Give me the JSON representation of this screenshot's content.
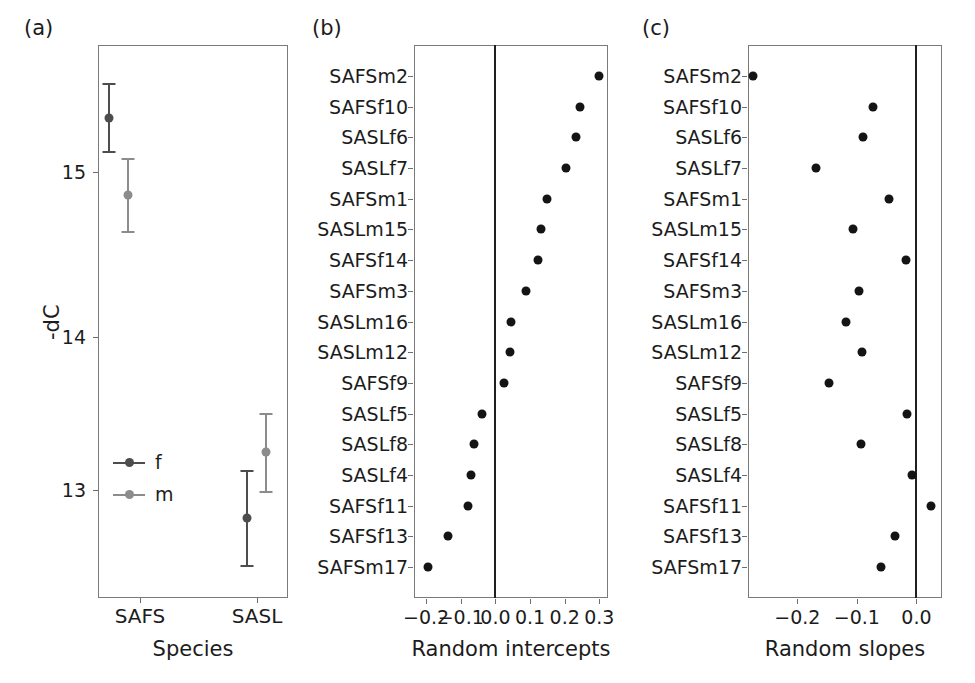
{
  "figure": {
    "background": "#ffffff",
    "point_color": "#141414",
    "female_color": "#4d4d4d",
    "male_color": "#8c8c8c",
    "axis_color": "#7a7a7a"
  },
  "panel_a": {
    "tag": "(a)",
    "ylabel": "-dC",
    "xlabel": "Species",
    "y_ticks": [
      "15",
      "14",
      "13"
    ],
    "y_tick_values": [
      15,
      14,
      13
    ],
    "categories": [
      "SAFS",
      "SASL"
    ],
    "legend": [
      {
        "key": "f",
        "label": "f",
        "color": "#4d4d4d"
      },
      {
        "key": "m",
        "label": "m",
        "color": "#8c8c8c"
      }
    ]
  },
  "panel_b": {
    "tag": "(b)",
    "xlabel": "Random intercepts",
    "x_ticks": [
      "−0.2",
      "−0.1",
      "0.0",
      "0.1",
      "0.2",
      "0.3"
    ],
    "x_tick_values": [
      -0.2,
      -0.1,
      0.0,
      0.1,
      0.2,
      0.3
    ]
  },
  "panel_c": {
    "tag": "(c)",
    "xlabel": "Random slopes",
    "x_ticks": [
      "−0.2",
      "−0.1",
      "0.0"
    ],
    "x_tick_values": [
      -0.2,
      -0.1,
      0.0
    ]
  },
  "chart_data": [
    {
      "type": "scatter",
      "panel": "a",
      "title": "",
      "xlabel": "Species",
      "ylabel": "-dC",
      "x_categories": [
        "SAFS",
        "SASL"
      ],
      "ylim": [
        12.35,
        15.75
      ],
      "yticks": [
        13,
        14,
        15
      ],
      "grid": false,
      "legend": [
        "f",
        "m"
      ],
      "legend_position": "inside-lower-left",
      "series": [
        {
          "name": "f",
          "color": "#4d4d4d",
          "points": [
            {
              "category": "SAFS",
              "mean": 15.31,
              "low": 15.09,
              "high": 15.53
            },
            {
              "category": "SASL",
              "mean": 12.78,
              "low": 12.56,
              "high": 13.01
            }
          ]
        },
        {
          "name": "m",
          "color": "#8c8c8c",
          "points": [
            {
              "category": "SAFS",
              "mean": 14.84,
              "low": 14.62,
              "high": 15.06
            },
            {
              "category": "SASL",
              "mean": 13.22,
              "low": 12.97,
              "high": 13.47
            }
          ]
        }
      ]
    },
    {
      "type": "scatter",
      "panel": "b",
      "title": "",
      "xlabel": "Random intercepts",
      "ylabel": "",
      "xlim": [
        -0.235,
        0.325
      ],
      "xticks": [
        -0.2,
        -0.1,
        0.0,
        0.1,
        0.2,
        0.3
      ],
      "grid": false,
      "reference_line": 0.0,
      "categories": [
        "SAFSm2",
        "SAFSf10",
        "SASLf6",
        "SASLf7",
        "SAFSm1",
        "SASLm15",
        "SAFSf14",
        "SAFSm3",
        "SASLm16",
        "SASLm12",
        "SAFSf9",
        "SASLf5",
        "SASLf8",
        "SASLf4",
        "SAFSf11",
        "SAFSf13",
        "SAFSm17"
      ],
      "values": [
        0.298,
        0.244,
        0.233,
        0.203,
        0.149,
        0.132,
        0.124,
        0.087,
        0.046,
        0.042,
        0.024,
        -0.038,
        -0.063,
        -0.07,
        -0.079,
        -0.136,
        -0.196
      ]
    },
    {
      "type": "scatter",
      "panel": "c",
      "title": "",
      "xlabel": "Random slopes",
      "ylabel": "",
      "xlim": [
        -0.283,
        0.043
      ],
      "xticks": [
        -0.2,
        -0.1,
        0.0
      ],
      "grid": false,
      "reference_line": 0.0,
      "categories": [
        "SAFSm2",
        "SAFSf10",
        "SASLf6",
        "SASLf7",
        "SAFSm1",
        "SASLm15",
        "SAFSf14",
        "SAFSm3",
        "SASLm16",
        "SASLm12",
        "SAFSf9",
        "SASLf5",
        "SASLf8",
        "SASLf4",
        "SAFSf11",
        "SAFSf13",
        "SAFSm17"
      ],
      "values": [
        -0.275,
        -0.073,
        -0.09,
        -0.169,
        -0.046,
        -0.106,
        -0.017,
        -0.096,
        -0.118,
        -0.092,
        -0.147,
        -0.016,
        -0.093,
        -0.008,
        0.025,
        -0.036,
        -0.06
      ]
    }
  ]
}
